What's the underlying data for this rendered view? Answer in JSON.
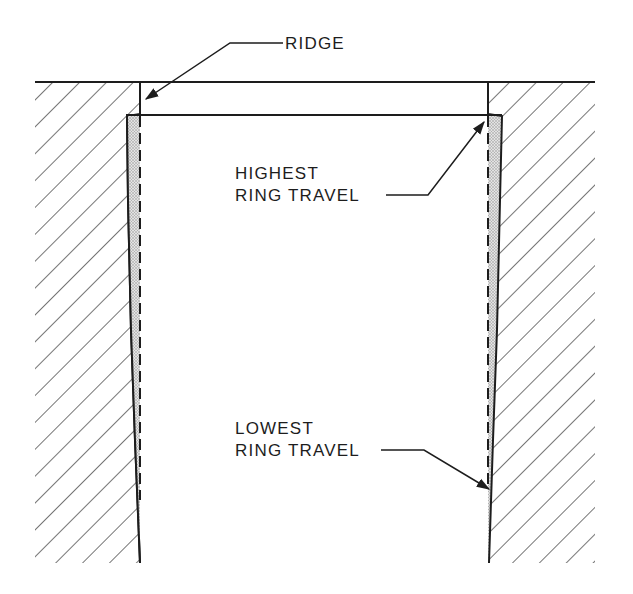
{
  "figure": {
    "type": "cylinder bore wear cross-section",
    "labels": {
      "ridge": "RIDGE",
      "highest_line1": "HIGHEST",
      "highest_line2": "RING TRAVEL",
      "lowest_line1": "LOWEST",
      "lowest_line2": "RING TRAVEL"
    },
    "caption_visible": "",
    "colors": {
      "line": "#1d1d1d",
      "hatch": "#3a3a3a",
      "wear_fill": "#cfcfcf",
      "background": "#ffffff"
    }
  }
}
